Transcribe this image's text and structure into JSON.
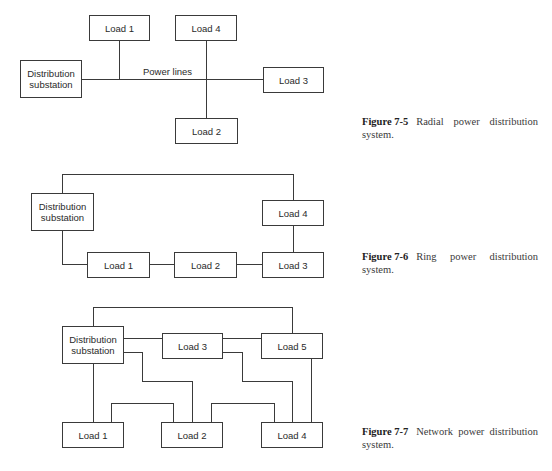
{
  "figures": [
    {
      "id": "fig-7-5",
      "number": "Figure 7-5",
      "caption": "Radial power distribution",
      "caption_line2": "system.",
      "nodes": {
        "substation": "Distribution substation",
        "load1": "Load 1",
        "load2": "Load 2",
        "load3": "Load 3",
        "load4": "Load 4"
      },
      "line_label": "Power lines"
    },
    {
      "id": "fig-7-6",
      "number": "Figure 7-6",
      "caption": "Ring power distribution",
      "caption_line2": "system.",
      "nodes": {
        "substation": "Distribution substation",
        "load1": "Load 1",
        "load2": "Load 2",
        "load3": "Load 3",
        "load4": "Load 4"
      }
    },
    {
      "id": "fig-7-7",
      "number": "Figure 7-7",
      "caption": "Network power distribution",
      "caption_line2": "system.",
      "nodes": {
        "substation": "Distribution substation",
        "load1": "Load 1",
        "load2": "Load 2",
        "load3": "Load 3",
        "load4": "Load 4",
        "load5": "Load 5"
      }
    }
  ],
  "colors": {
    "line": "#3a3a3a",
    "text": "#2a2a2a",
    "background": "#ffffff"
  }
}
